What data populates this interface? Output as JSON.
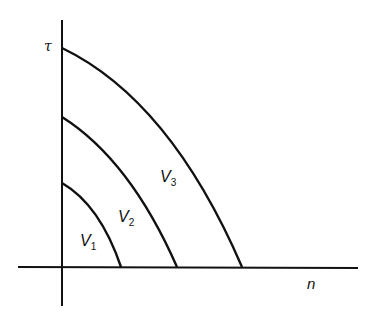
{
  "diagram": {
    "y_axis_label": "τ",
    "x_axis_label": "n",
    "curves": [
      {
        "name": "V",
        "subscript": "1"
      },
      {
        "name": "V",
        "subscript": "2"
      },
      {
        "name": "V",
        "subscript": "3"
      }
    ],
    "line_color": "#111111"
  }
}
